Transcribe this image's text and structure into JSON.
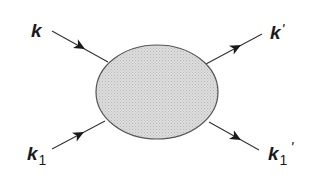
{
  "diagram": {
    "title": "",
    "blob": {
      "name": "interaction-vertex",
      "fill": "#d4d4d4",
      "stroke": "#555555"
    },
    "line_color": "#333333",
    "legs": [
      {
        "id": "k",
        "direction": "incoming",
        "label": {
          "main": "k",
          "sub": "",
          "prime": ""
        }
      },
      {
        "id": "k-prime",
        "direction": "outgoing",
        "label": {
          "main": "k",
          "sub": "",
          "prime": "'"
        }
      },
      {
        "id": "k1",
        "direction": "incoming",
        "label": {
          "main": "k",
          "sub": "1",
          "prime": ""
        }
      },
      {
        "id": "k1-prime",
        "direction": "outgoing",
        "label": {
          "main": "k",
          "sub": "1",
          "prime": "'"
        }
      }
    ]
  }
}
